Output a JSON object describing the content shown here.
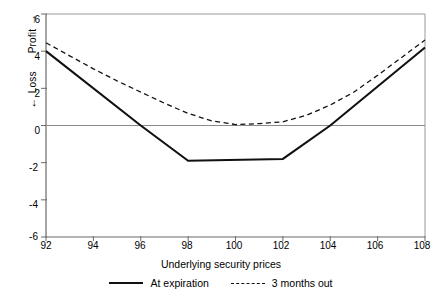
{
  "chart_data": {
    "type": "line",
    "title": "",
    "xlabel": "Underlying security prices",
    "ylabel": "Profit / Loss",
    "ylabel_parts": {
      "profit": "Profit",
      "loss": "Loss",
      "up_arrow": "↑",
      "down_arrow": "↓"
    },
    "xlim": [
      92,
      108
    ],
    "ylim": [
      -6,
      6
    ],
    "xticks": [
      92,
      94,
      96,
      98,
      100,
      102,
      104,
      106,
      108
    ],
    "xtick_labels": [
      "92",
      "94",
      "96",
      "98",
      "100",
      "102",
      "104",
      "106",
      "108"
    ],
    "yticks": [
      6,
      4,
      2,
      0,
      -2,
      -4,
      -6
    ],
    "ytick_labels": [
      "6",
      "4",
      "2",
      "0",
      "-2",
      "-4",
      "-6"
    ],
    "grid": false,
    "zero_line": true,
    "legend_position": "below",
    "series": [
      {
        "name": "At expiration",
        "style": "solid",
        "color": "#111111",
        "x": [
          92,
          96,
          98,
          102,
          104,
          108
        ],
        "values": [
          4.0,
          0.0,
          -1.9,
          -1.8,
          0.0,
          4.2
        ]
      },
      {
        "name": "3 months out",
        "style": "dashed",
        "color": "#111111",
        "x": [
          92,
          93,
          94,
          95,
          96,
          97,
          98,
          99,
          100,
          101,
          102,
          103,
          104,
          105,
          106,
          107,
          108
        ],
        "values": [
          4.45,
          3.75,
          3.05,
          2.4,
          1.8,
          1.2,
          0.65,
          0.25,
          0.05,
          0.1,
          0.2,
          0.55,
          1.1,
          1.8,
          2.7,
          3.65,
          4.6
        ]
      }
    ]
  },
  "legend": {
    "entries": [
      {
        "label": "At expiration",
        "style": "solid"
      },
      {
        "label": "3 months out",
        "style": "dashed"
      }
    ]
  },
  "colors": {
    "line": "#111111",
    "axis": "#6b6b6b",
    "zero_line": "#8a8a8a",
    "background": "#ffffff"
  }
}
